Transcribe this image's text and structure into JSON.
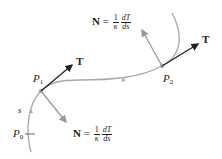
{
  "diagram": {
    "curve_color": "#a8a8a8",
    "tangent_color": "#222222",
    "normal_color": "#9a9a9a",
    "points": [
      {
        "name": "P",
        "sub": "0"
      },
      {
        "name": "P",
        "sub": "1"
      },
      {
        "name": "P",
        "sub": "2"
      }
    ],
    "arc_label": "s",
    "tangent_label": "T",
    "normal_top": {
      "lhs": "N",
      "eq": "=",
      "frac1_num": "1",
      "frac1_den": "κ",
      "frac2_num": "dT",
      "frac2_den": "ds"
    },
    "normal_bottom": {
      "lhs": "N",
      "eq": "=",
      "frac1_num": "1",
      "frac1_den": "κ",
      "frac2_num": "dT",
      "frac2_den": "ds"
    }
  }
}
